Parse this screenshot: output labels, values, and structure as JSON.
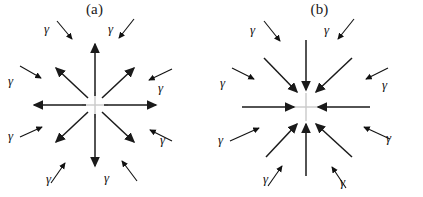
{
  "figure": {
    "background_color": "#ffffff",
    "stroke_color": "#1a1a1a",
    "center_marker_color": "#bdbdbd",
    "panel_count": 2
  },
  "panels": [
    {
      "id": "a",
      "label": "(a)",
      "center": {
        "x": 95,
        "y": 105
      },
      "center_marker": "gray-cross",
      "main_arrow_direction": "outward",
      "main_arrow_count": 8,
      "gamma_arrow_direction": "inward",
      "gamma_symbol": "γ",
      "gamma_count": 8,
      "gamma_labels": [
        {
          "id": "nw",
          "text": "γ",
          "x": 44,
          "y": 22
        },
        {
          "id": "ne",
          "text": "γ",
          "x": 108,
          "y": 22
        },
        {
          "id": "w",
          "text": "γ",
          "x": 8,
          "y": 74
        },
        {
          "id": "e",
          "text": "γ",
          "x": 158,
          "y": 81
        },
        {
          "id": "sw",
          "text": "γ",
          "x": 8,
          "y": 129
        },
        {
          "id": "se",
          "text": "γ",
          "x": 160,
          "y": 133
        },
        {
          "id": "ssw",
          "text": "γ",
          "x": 46,
          "y": 172
        },
        {
          "id": "sse",
          "text": "γ",
          "x": 104,
          "y": 171
        }
      ]
    },
    {
      "id": "b",
      "label": "(b)",
      "center": {
        "x": 94,
        "y": 107
      },
      "center_marker": "gray-cross",
      "main_arrow_direction": "inward",
      "main_arrow_count": 8,
      "gamma_arrow_direction": "inward",
      "gamma_symbol": "γ",
      "gamma_count": 8,
      "gamma_labels": [
        {
          "id": "nw",
          "text": "γ",
          "x": 38,
          "y": 23
        },
        {
          "id": "ne",
          "text": "γ",
          "x": 112,
          "y": 23
        },
        {
          "id": "w",
          "text": "γ",
          "x": 8,
          "y": 76
        },
        {
          "id": "e",
          "text": "γ",
          "x": 170,
          "y": 78
        },
        {
          "id": "sw",
          "text": "γ",
          "x": 6,
          "y": 133
        },
        {
          "id": "se",
          "text": "γ",
          "x": 174,
          "y": 131
        },
        {
          "id": "ssw",
          "text": "γ",
          "x": 51,
          "y": 172
        },
        {
          "id": "sse",
          "text": "γ",
          "x": 128,
          "y": 175
        }
      ]
    }
  ]
}
